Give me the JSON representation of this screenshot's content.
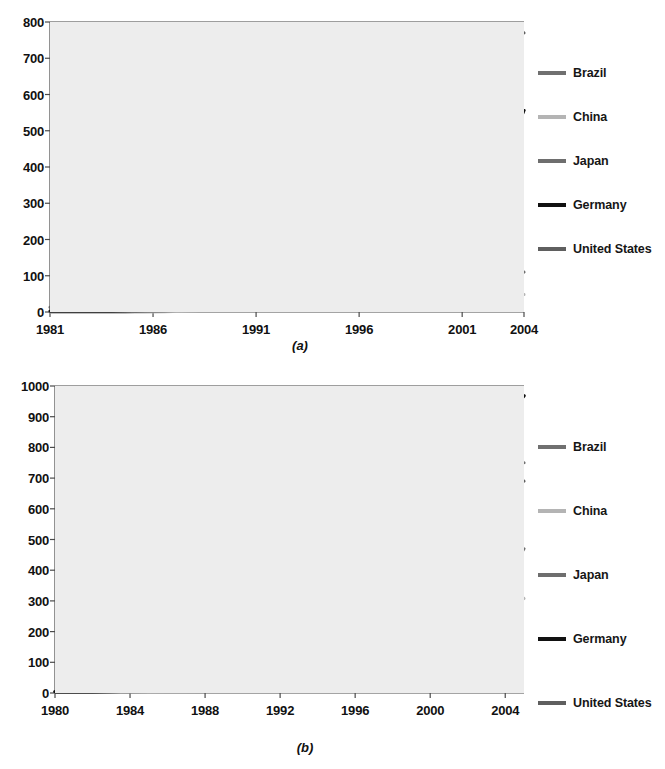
{
  "figure": {
    "panels": [
      {
        "caption": "(a)"
      },
      {
        "caption": "(b)"
      }
    ]
  },
  "legend": {
    "position": "right",
    "entries": [
      {
        "label": "Brazil",
        "color": "#707070"
      },
      {
        "label": "China",
        "color": "#b4b4b4"
      },
      {
        "label": "Japan",
        "color": "#6e6e6e"
      },
      {
        "label": "Germany",
        "color": "#111111"
      },
      {
        "label": "United States",
        "color": "#5f5f5f"
      }
    ]
  },
  "chart_data": [
    {
      "type": "line",
      "title": "",
      "subtitle": "(a)",
      "xlabel": "",
      "ylabel": "",
      "xlim": [
        1981,
        2004
      ],
      "ylim": [
        0,
        800
      ],
      "xticks": [
        1981,
        1986,
        1991,
        1996,
        2001,
        2004
      ],
      "yticks": [
        0,
        100,
        200,
        300,
        400,
        500,
        600,
        700,
        800
      ],
      "grid": true,
      "legend_position": "right",
      "x": [
        1981,
        1982,
        1983,
        1984,
        1985,
        1986,
        1987,
        1988,
        1989,
        1990,
        1991,
        1992,
        1993,
        1994,
        1995,
        1996,
        1997,
        1998,
        1999,
        2000,
        2001,
        2002,
        2003
      ],
      "series": [
        {
          "name": "United States",
          "color": "#5f5f5f",
          "width": 3,
          "values": [
            13,
            22,
            55,
            95,
            130,
            163,
            196,
            222,
            243,
            262,
            278,
            300,
            335,
            378,
            425,
            470,
            510,
            560,
            612,
            660,
            705,
            740,
            770
          ]
        },
        {
          "name": "Germany",
          "color": "#111111",
          "width": 3,
          "values": [
            3,
            3,
            3,
            3,
            4,
            6,
            8,
            52,
            84,
            80,
            90,
            105,
            110,
            118,
            130,
            150,
            178,
            205,
            240,
            275,
            300,
            352,
            430,
            556
          ]
        },
        {
          "name": "Brazil",
          "color": "#707070",
          "width": 3,
          "values": [
            2,
            2,
            2,
            2,
            3,
            10,
            28,
            40,
            50,
            58,
            66,
            74,
            80,
            86,
            96,
            120,
            150,
            185,
            225,
            265,
            300,
            355,
            412,
            556
          ]
        },
        {
          "name": "Japan",
          "color": "#6e6e6e",
          "width": 3,
          "values": [
            1,
            1,
            1,
            1,
            1,
            2,
            3,
            5,
            8,
            11,
            12,
            12,
            12,
            11,
            11,
            15,
            22,
            27,
            29,
            30,
            22,
            40,
            55,
            72,
            88,
            110
          ]
        },
        {
          "name": "China",
          "color": "#b4b4b4",
          "width": 3,
          "values": [
            0,
            0,
            0,
            0,
            0,
            0,
            1,
            2,
            4,
            8,
            9,
            9,
            9,
            8,
            8,
            9,
            12,
            14,
            16,
            18,
            18,
            24,
            32,
            40,
            45,
            48
          ]
        }
      ],
      "series_notes": {
        "United States": "highest line, ends near 770 at 2004",
        "Germany": "black line, ends near 555 at 2003",
        "Brazil": "converges with Germany near 555 at 2003 after a step at 412",
        "Japan": "ends near 110",
        "China": "lowest line, ends near 48"
      }
    },
    {
      "type": "line",
      "title": "",
      "subtitle": "(b)",
      "xlabel": "",
      "ylabel": "",
      "xlim": [
        1980,
        2005
      ],
      "ylim": [
        0,
        1000
      ],
      "xticks": [
        1980,
        1984,
        1988,
        1992,
        1996,
        2000,
        2004
      ],
      "yticks": [
        0,
        100,
        200,
        300,
        400,
        500,
        600,
        700,
        800,
        900,
        1000
      ],
      "grid": true,
      "legend_position": "right",
      "x": [
        1980,
        1981,
        1982,
        1983,
        1984,
        1985,
        1986,
        1987,
        1988,
        1989,
        1990,
        1991,
        1992,
        1993,
        1994,
        1995,
        1996,
        1997,
        1998,
        1999,
        2000,
        2001,
        2002,
        2003,
        2004,
        2005
      ],
      "series": [
        {
          "name": "Germany",
          "color": "#111111",
          "width": 3.4,
          "values": [
            4,
            4,
            4,
            5,
            6,
            7,
            8,
            10,
            13,
            17,
            22,
            30,
            42,
            58,
            80,
            108,
            150,
            215,
            300,
            420,
            590,
            690,
            745,
            820,
            900,
            968
          ]
        },
        {
          "name": "Brazil",
          "color": "#707070",
          "width": 3,
          "values": [
            4,
            4,
            5,
            6,
            7,
            9,
            12,
            16,
            22,
            32,
            48,
            72,
            110,
            160,
            215,
            290,
            370,
            430,
            455,
            395,
            455,
            545,
            620,
            680,
            720,
            750
          ]
        },
        {
          "name": "United States",
          "color": "#5f5f5f",
          "width": 3,
          "values": [
            5,
            6,
            7,
            9,
            12,
            16,
            22,
            30,
            42,
            58,
            78,
            100,
            128,
            160,
            196,
            235,
            272,
            305,
            345,
            390,
            440,
            500,
            560,
            615,
            660,
            690
          ]
        },
        {
          "name": "Japan",
          "color": "#6e6e6e",
          "width": 3,
          "values": [
            3,
            3,
            3,
            4,
            4,
            5,
            6,
            7,
            8,
            10,
            12,
            15,
            19,
            24,
            30,
            38,
            48,
            58,
            62,
            90,
            140,
            175,
            215,
            280,
            370,
            470
          ]
        },
        {
          "name": "China",
          "color": "#b4b4b4",
          "width": 3,
          "values": [
            2,
            2,
            2,
            2,
            3,
            3,
            4,
            4,
            5,
            6,
            7,
            8,
            10,
            13,
            16,
            20,
            26,
            33,
            40,
            46,
            90,
            140,
            180,
            225,
            270,
            308
          ]
        }
      ],
      "series_notes": {
        "Germany": "black, steepest, ends near 970",
        "Brazil": "dip near 1999 from 455 down to 395, ends near 750",
        "United States": "ends near 690",
        "Japan": "ends near 470",
        "China": "lowest, ends near 310"
      }
    }
  ]
}
